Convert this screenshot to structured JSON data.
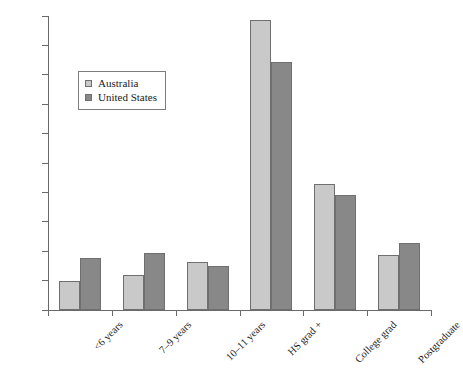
{
  "chart_data": {
    "type": "bar",
    "title": "",
    "subtitle": "",
    "xlabel": "",
    "ylabel": "",
    "ylim": [
      0,
      50
    ],
    "ytick_step": 5,
    "yticks": [
      "0",
      "5",
      "10",
      "15",
      "20",
      "25",
      "30",
      "35",
      "40",
      "45",
      "50"
    ],
    "grid": false,
    "legend_position": "upper-left-inside",
    "categories": [
      "<6 years",
      "7–9 years",
      "10–11 years",
      "HS grad +",
      "College grad",
      "Postgraduate"
    ],
    "series": [
      {
        "name": "Australia",
        "color": "#c9c9c9",
        "values": [
          5.0,
          6.0,
          8.1,
          49.3,
          21.5,
          9.3
        ]
      },
      {
        "name": "United States",
        "color": "#888888",
        "values": [
          8.9,
          9.7,
          7.5,
          42.2,
          19.6,
          11.4
        ]
      }
    ]
  },
  "axis": {
    "line_color": "#6a6a6a"
  }
}
